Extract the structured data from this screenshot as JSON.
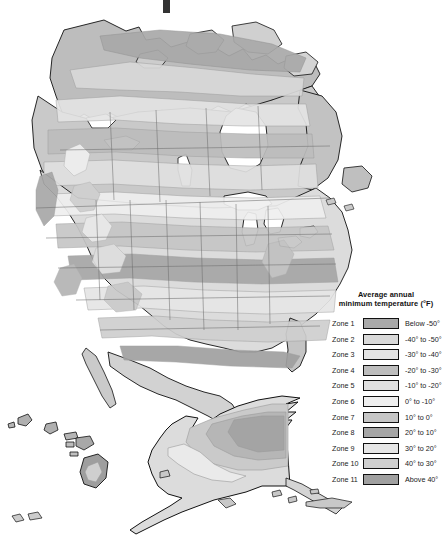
{
  "figure": {
    "type": "thematic-choropleth-map",
    "region": "North America",
    "background_color": "#ffffff",
    "outline_color": "#111111",
    "has_alaska_inset": true,
    "has_hawaii_inset": true
  },
  "legend": {
    "title_line1": "Average annual",
    "title_line2": "minimum temperature (°F)",
    "rows": [
      {
        "zone": "Zone 1",
        "range": "Below -50°",
        "swatch": "#a9a9a9"
      },
      {
        "zone": "Zone 2",
        "range": "-40° to -50°",
        "swatch": "#d9d9d9"
      },
      {
        "zone": "Zone 3",
        "range": "-30° to -40°",
        "swatch": "#e4e4e4"
      },
      {
        "zone": "Zone 4",
        "range": "-20° to -30°",
        "swatch": "#bdbdbd"
      },
      {
        "zone": "Zone 5",
        "range": "-10° to -20°",
        "swatch": "#e0e0e0"
      },
      {
        "zone": "Zone 6",
        "range": "0° to -10°",
        "swatch": "#efefef"
      },
      {
        "zone": "Zone 7",
        "range": "10° to 0°",
        "swatch": "#c6c6c6"
      },
      {
        "zone": "Zone 8",
        "range": "20° to 10°",
        "swatch": "#a6a6a6"
      },
      {
        "zone": "Zone 9",
        "range": "30° to 20°",
        "swatch": "#e6e6e6"
      },
      {
        "zone": "Zone 10",
        "range": "40° to 30°",
        "swatch": "#cfcfcf"
      },
      {
        "zone": "Zone 11",
        "range": "Above 40°",
        "swatch": "#a0a0a0"
      }
    ]
  },
  "palette": {
    "z1": "#a9a9a9",
    "z2": "#d9d9d9",
    "z3": "#e4e4e4",
    "z4": "#bdbdbd",
    "z5": "#e0e0e0",
    "z6": "#efefef",
    "z7": "#c6c6c6",
    "z8": "#a6a6a6",
    "z9": "#e6e6e6",
    "z10": "#cfcfcf",
    "z11": "#a0a0a0",
    "water": "#ffffff",
    "coast": "#111111",
    "admin_border": "#6e6e6e"
  }
}
